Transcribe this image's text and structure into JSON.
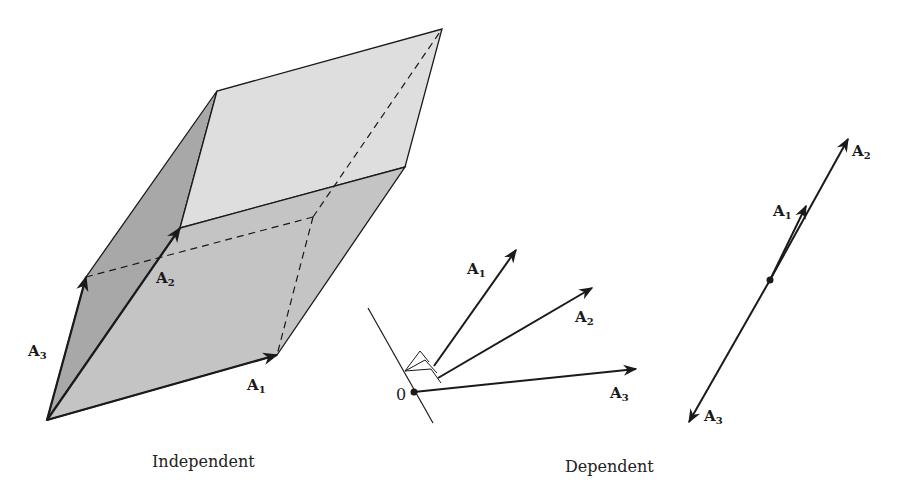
{
  "figure": {
    "independent": {
      "caption": "Independent",
      "labels": {
        "a1": "A",
        "a1_sub": "1",
        "a2": "A",
        "a2_sub": "2",
        "a3": "A",
        "a3_sub": "3"
      }
    },
    "dependent_plane": {
      "origin_label": "0",
      "labels": {
        "a1": "A",
        "a1_sub": "1",
        "a2": "A",
        "a2_sub": "2",
        "a3": "A",
        "a3_sub": "3"
      }
    },
    "dependent_line": {
      "labels": {
        "a1": "A",
        "a1_sub": "1",
        "a2": "A",
        "a2_sub": "2",
        "a3": "A",
        "a3_sub": "3"
      }
    },
    "dependent_caption": "Dependent",
    "colors": {
      "face_front": "#c4c4c4",
      "face_side": "#a8a8a8",
      "face_top": "#dedede",
      "stroke": "#1a1a1a"
    }
  }
}
